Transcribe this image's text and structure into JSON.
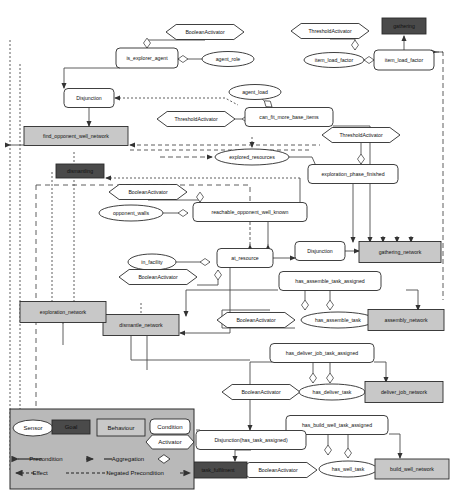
{
  "diagram": {
    "colors": {
      "goal_fill": "#4a4a4a",
      "goal_text": "#e8e8e8",
      "behaviour_fill": "#c8c8c8",
      "condition_fill": "#ffffff",
      "sensor_fill": "#ffffff",
      "activator_fill": "#ffffff",
      "legend_fill": "#b9b9b9",
      "stroke": "#2a2a2a",
      "edge": "#4d4d4d"
    },
    "nodes": [
      {
        "id": "booleanactivator_1",
        "label": "BooleanActivator",
        "type": "activator",
        "shape": "hexagon",
        "x": 205,
        "y": 32,
        "w": 78,
        "h": 15
      },
      {
        "id": "is_explorer_agent",
        "label": "is_explorer_agent",
        "type": "condition",
        "shape": "roundrect",
        "x": 147,
        "y": 58,
        "w": 62,
        "h": 20
      },
      {
        "id": "agent_role",
        "label": "agent_role",
        "type": "sensor",
        "shape": "ellipse",
        "x": 228,
        "y": 59,
        "w": 52,
        "h": 15
      },
      {
        "id": "thresholdactivator_1",
        "label": "ThresholdActivator",
        "type": "activator",
        "shape": "hexagon",
        "x": 330,
        "y": 31,
        "w": 78,
        "h": 15
      },
      {
        "id": "gathering",
        "label": "gathering",
        "type": "goal",
        "shape": "rect",
        "x": 404,
        "y": 26,
        "w": 44,
        "h": 16
      },
      {
        "id": "item_load_factor_sensor",
        "label": "item_load_factor",
        "type": "sensor",
        "shape": "ellipse",
        "x": 334,
        "y": 60,
        "w": 60,
        "h": 15
      },
      {
        "id": "item_load_factor_cond",
        "label": "item_load_factor",
        "type": "condition",
        "shape": "roundrect",
        "x": 404,
        "y": 60,
        "w": 60,
        "h": 20
      },
      {
        "id": "disjunction_1",
        "label": "Disjunction",
        "type": "condition",
        "shape": "roundrect",
        "x": 89,
        "y": 98,
        "w": 50,
        "h": 19
      },
      {
        "id": "agent_load",
        "label": "agent_load",
        "type": "sensor",
        "shape": "ellipse",
        "x": 255,
        "y": 92,
        "w": 52,
        "h": 15
      },
      {
        "id": "thresholdactivator_2",
        "label": "ThresholdActivator",
        "type": "activator",
        "shape": "hexagon",
        "x": 196,
        "y": 119,
        "w": 78,
        "h": 15
      },
      {
        "id": "can_fit_more_base_items",
        "label": "can_fit_more_base_items",
        "type": "condition",
        "shape": "roundrect",
        "x": 289,
        "y": 117,
        "w": 88,
        "h": 19
      },
      {
        "id": "find_opponent_well_network",
        "label": "find_opponent_well_network",
        "type": "behaviour",
        "shape": "rect",
        "x": 76,
        "y": 136,
        "w": 104,
        "h": 19
      },
      {
        "id": "thresholdactivator_3",
        "label": "ThresholdActivator",
        "type": "activator",
        "shape": "hexagon",
        "x": 361,
        "y": 135,
        "w": 78,
        "h": 15
      },
      {
        "id": "explored_resources",
        "label": "explored_resources",
        "type": "sensor",
        "shape": "ellipse",
        "x": 252,
        "y": 157,
        "w": 74,
        "h": 16
      },
      {
        "id": "exploration_phase_finished",
        "label": "exploration_phase_finished",
        "type": "condition",
        "shape": "roundrect",
        "x": 353,
        "y": 174,
        "w": 90,
        "h": 19
      },
      {
        "id": "dismantling",
        "label": "dismantling",
        "type": "goal",
        "shape": "rect",
        "x": 80,
        "y": 171,
        "w": 48,
        "h": 14
      },
      {
        "id": "booleanactivator_2",
        "label": "BooleanActivator",
        "type": "activator",
        "shape": "hexagon",
        "x": 148,
        "y": 192,
        "w": 78,
        "h": 15
      },
      {
        "id": "opponent_walls",
        "label": "opponent_walls",
        "type": "sensor",
        "shape": "ellipse",
        "x": 131,
        "y": 213,
        "w": 64,
        "h": 16
      },
      {
        "id": "reachable_opponent_well_known",
        "label": "reachable_opponent_well_known",
        "type": "condition",
        "shape": "roundrect",
        "x": 250,
        "y": 212,
        "w": 114,
        "h": 19
      },
      {
        "id": "in_facility",
        "label": "in_facility",
        "type": "sensor",
        "shape": "ellipse",
        "x": 152,
        "y": 262,
        "w": 48,
        "h": 16
      },
      {
        "id": "at_resource",
        "label": "at_resource",
        "type": "condition",
        "shape": "roundrect",
        "x": 245,
        "y": 258,
        "w": 56,
        "h": 19
      },
      {
        "id": "disjunction_2",
        "label": "Disjunction",
        "type": "condition",
        "shape": "roundrect",
        "x": 320,
        "y": 251,
        "w": 50,
        "h": 19
      },
      {
        "id": "gathering_network",
        "label": "gathering_network",
        "type": "behaviour",
        "shape": "rect",
        "x": 400,
        "y": 252,
        "w": 82,
        "h": 21
      },
      {
        "id": "booleanactivator_3",
        "label": "BooleanActivator",
        "type": "activator",
        "shape": "hexagon",
        "x": 158,
        "y": 277,
        "w": 78,
        "h": 15
      },
      {
        "id": "has_assemble_task_assigned",
        "label": "has_assemble_task_assigned",
        "type": "condition",
        "shape": "roundrect",
        "x": 330,
        "y": 281,
        "w": 102,
        "h": 19
      },
      {
        "id": "booleanactivator_4",
        "label": "BooleanActivator",
        "type": "activator",
        "shape": "hexagon",
        "x": 256,
        "y": 320,
        "w": 78,
        "h": 15
      },
      {
        "id": "has_assemble_task",
        "label": "has_assemble_task",
        "type": "sensor",
        "shape": "ellipse",
        "x": 338,
        "y": 320,
        "w": 74,
        "h": 16
      },
      {
        "id": "assembly_network",
        "label": "assembly_network",
        "type": "behaviour",
        "shape": "rect",
        "x": 406,
        "y": 320,
        "w": 76,
        "h": 21
      },
      {
        "id": "dismantle_network",
        "label": "dismantle_network",
        "type": "behaviour",
        "shape": "rect",
        "x": 141,
        "y": 325,
        "w": 76,
        "h": 21
      },
      {
        "id": "has_deliver_job_task_assigned",
        "label": "has_deliver_job_task_assigned",
        "type": "condition",
        "shape": "roundrect",
        "x": 322,
        "y": 353,
        "w": 104,
        "h": 19
      },
      {
        "id": "booleanactivator_5",
        "label": "BooleanActivator",
        "type": "activator",
        "shape": "hexagon",
        "x": 261,
        "y": 392,
        "w": 78,
        "h": 15
      },
      {
        "id": "has_deliver_task",
        "label": "has_deliver_task",
        "type": "sensor",
        "shape": "ellipse",
        "x": 332,
        "y": 392,
        "w": 66,
        "h": 16
      },
      {
        "id": "deliver_job_network",
        "label": "deliver_job_network",
        "type": "behaviour",
        "shape": "rect",
        "x": 404,
        "y": 392,
        "w": 78,
        "h": 21
      },
      {
        "id": "has_build_well_task_assigned",
        "label": "has_build_well_task_assigned",
        "type": "condition",
        "shape": "roundrect",
        "x": 337,
        "y": 425,
        "w": 102,
        "h": 19
      },
      {
        "id": "disjunction_has_task",
        "label": "Disjunction(has_task_assigned)",
        "type": "condition",
        "shape": "roundrect",
        "x": 251,
        "y": 440,
        "w": 110,
        "h": 19
      },
      {
        "id": "booleanactivator_6",
        "label": "BooleanActivator",
        "type": "activator",
        "shape": "hexagon",
        "x": 278,
        "y": 470,
        "w": 78,
        "h": 15
      },
      {
        "id": "has_well_task",
        "label": "has_well_task",
        "type": "sensor",
        "shape": "ellipse",
        "x": 348,
        "y": 469,
        "w": 58,
        "h": 16
      },
      {
        "id": "build_well_network",
        "label": "build_well_network",
        "type": "behaviour",
        "shape": "rect",
        "x": 412,
        "y": 469,
        "w": 74,
        "h": 20
      },
      {
        "id": "task_fulfilment",
        "label": "task_fulfilment",
        "type": "goal",
        "shape": "rect",
        "x": 218,
        "y": 470,
        "w": 58,
        "h": 16
      },
      {
        "id": "exploration_network",
        "label": "exploration_network",
        "type": "behaviour",
        "shape": "rect",
        "x": 63,
        "y": 312,
        "w": 86,
        "h": 21
      }
    ],
    "legend": {
      "title": "Legend",
      "x": 10,
      "y": 409,
      "w": 184,
      "h": 80,
      "shapes": [
        {
          "key": "sensor",
          "label": "Sensor",
          "shape": "ellipse"
        },
        {
          "key": "goal",
          "label": "Goal",
          "shape": "rect"
        },
        {
          "key": "behaviour",
          "label": "Behaviour",
          "shape": "rect"
        },
        {
          "key": "condition",
          "label": "Condition",
          "shape": "roundrect"
        },
        {
          "key": "activator",
          "label": "Activator",
          "shape": "hexagon"
        }
      ],
      "edges": [
        {
          "key": "precondition",
          "label": "Precondition",
          "style": "solid",
          "marker": "arrow"
        },
        {
          "key": "aggregation",
          "label": "Aggregation",
          "style": "solid",
          "marker": "diamond"
        },
        {
          "key": "effect",
          "label": "Effect",
          "style": "dashed",
          "marker": "arrow-left"
        },
        {
          "key": "negated_precondition",
          "label": "Negated Precondition",
          "style": "dashed",
          "marker": "arrow"
        }
      ]
    }
  }
}
